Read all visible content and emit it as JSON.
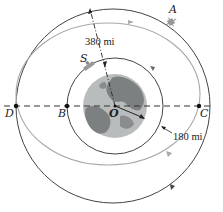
{
  "figure": {
    "labels": {
      "A": "A",
      "S": "S",
      "D": "D",
      "B": "B",
      "O": "O",
      "C": "C"
    },
    "dimensions": {
      "outer_altitude": "380 mi",
      "inner_altitude": "180 mi"
    },
    "colors": {
      "orbit_line": "#444444",
      "transfer_orbit": "#a8a8a8",
      "earth_ocean": "#b9bcbc",
      "earth_land": "#7d8080",
      "dashed_axis": "#333333"
    }
  }
}
